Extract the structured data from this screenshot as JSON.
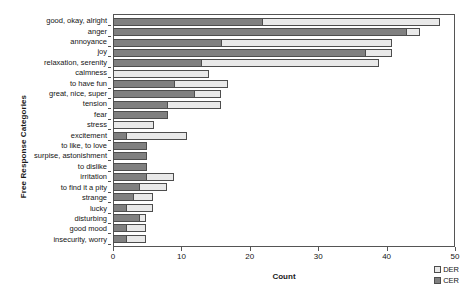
{
  "chart_data": {
    "type": "bar",
    "orientation": "horizontal",
    "stacked": true,
    "title": "",
    "xlabel": "Count",
    "ylabel": "Free Response Categories",
    "xlim": [
      0,
      50
    ],
    "xticks": [
      0,
      10,
      20,
      30,
      40,
      50
    ],
    "grid": false,
    "legend_position": "bottom-right",
    "categories": [
      "good, okay, alright",
      "anger",
      "annoyance",
      "joy",
      "relaxation, serenity",
      "calmness",
      "to have fun",
      "great, nice, super",
      "tension",
      "fear",
      "stress",
      "excitement",
      "to like, to love",
      "surpise, astonishment",
      "to dislike",
      "irritation",
      "to find it a pity",
      "strange",
      "lucky",
      "disturbing",
      "good mood",
      "insecurity, worry"
    ],
    "series": [
      {
        "name": "CER",
        "color": "#808080",
        "values": [
          22,
          43,
          16,
          37,
          13,
          0,
          9,
          12,
          8,
          8,
          0,
          2,
          5,
          5,
          5,
          5,
          4,
          3,
          2,
          4,
          2,
          2
        ]
      },
      {
        "name": "DER",
        "color": "#e9e9e9",
        "values": [
          26,
          2,
          25,
          4,
          26,
          14,
          8,
          4,
          8,
          0,
          6,
          9,
          0,
          0,
          0,
          4,
          4,
          3,
          4,
          1,
          3,
          3
        ]
      }
    ],
    "totals": [
      48,
      45,
      41,
      41,
      39,
      14,
      17,
      16,
      16,
      8,
      6,
      11,
      5,
      5,
      5,
      9,
      8,
      6,
      6,
      5,
      5,
      5
    ]
  },
  "legend": {
    "items": [
      {
        "label": "DER",
        "color": "#e9e9e9"
      },
      {
        "label": "CER",
        "color": "#808080"
      }
    ]
  }
}
